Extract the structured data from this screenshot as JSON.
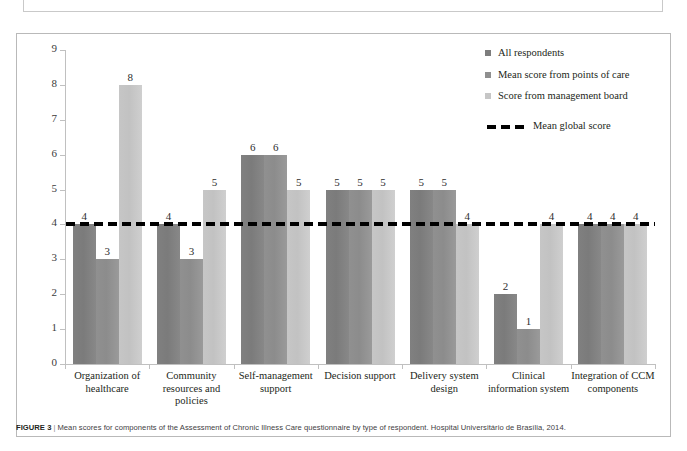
{
  "previous_caption_fragment": "Brasília, 2014.",
  "figure": {
    "label": "FIGURE 3",
    "separator": "|",
    "caption": "Mean scores for components of the Assessment of Chronic Illness Care questionnaire by type of respondent. Hospital Universitário de Brasília, 2014."
  },
  "legend": {
    "items": [
      {
        "label": "All respondents",
        "color": "#7d7d7d"
      },
      {
        "label": "Mean score from points of care",
        "color": "#8f8f8f"
      },
      {
        "label": "Score from management board",
        "color": "#c6c6c6"
      }
    ],
    "mean_line_label": "Mean global  score",
    "mean_line_color": "#000000"
  },
  "chart_data": {
    "type": "bar",
    "title": "",
    "xlabel": "",
    "ylabel": "",
    "ylim": [
      0,
      9
    ],
    "yticks": [
      0,
      1,
      2,
      3,
      4,
      5,
      6,
      7,
      8,
      9
    ],
    "ytick_labels": [
      "0",
      "1",
      "2",
      "3",
      "4",
      "5",
      "6",
      "7",
      "8",
      "9"
    ],
    "grid": false,
    "legend_position": "top-right",
    "categories": [
      "Organization of healthcare",
      "Community resources and policies",
      "Self-management support",
      "Decision support",
      "Delivery system design",
      "Clinical information system",
      "Integration of CCM components"
    ],
    "series": [
      {
        "name": "All respondents",
        "color": "#7d7d7d",
        "values": [
          4,
          4,
          6,
          5,
          5,
          2,
          4
        ]
      },
      {
        "name": "Mean score from points of care",
        "color": "#8f8f8f",
        "values": [
          3,
          3,
          6,
          5,
          5,
          1,
          4
        ]
      },
      {
        "name": "Score from management board",
        "color": "#c6c6c6",
        "values": [
          8,
          5,
          5,
          5,
          4,
          4,
          4
        ]
      }
    ],
    "reference_line": {
      "name": "Mean global  score",
      "value": 4,
      "style": "dashed",
      "color": "#000000"
    }
  }
}
